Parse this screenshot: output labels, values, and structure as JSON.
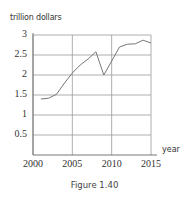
{
  "figure": {
    "caption": "Figure 1.40"
  },
  "chart_data": {
    "type": "line",
    "title": "",
    "xlabel": "year",
    "ylabel": "trillion dollars",
    "x": [
      2001,
      2002,
      2003,
      2004,
      2005,
      2006,
      2007,
      2008,
      2009,
      2010,
      2011,
      2012,
      2013,
      2014,
      2015
    ],
    "series": [
      {
        "name": "trillion dollars",
        "values": [
          1.4,
          1.42,
          1.52,
          1.8,
          2.05,
          2.25,
          2.4,
          2.58,
          2.0,
          2.35,
          2.7,
          2.77,
          2.78,
          2.87,
          2.8
        ]
      }
    ],
    "xlim": [
      2000,
      2015
    ],
    "ylim": [
      0,
      3
    ],
    "x_ticks": [
      "2000",
      "2005",
      "2010",
      "2015"
    ],
    "y_ticks": [
      "0.5",
      "1",
      "1.5",
      "2",
      "2.5",
      "3"
    ],
    "grid": true,
    "legend": "none"
  }
}
